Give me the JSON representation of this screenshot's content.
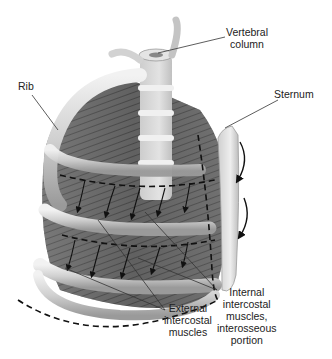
{
  "diagram": {
    "type": "anatomical illustration",
    "labels": {
      "vertebral_column": [
        "Vertebral",
        "column"
      ],
      "rib": [
        "Rib"
      ],
      "sternum": [
        "Sternum"
      ],
      "internal_intercostal": [
        "Internal",
        "intercostal",
        "muscles,",
        "interosseous",
        "portion"
      ],
      "external_intercostal": [
        "External",
        "intercostal",
        "muscles"
      ]
    },
    "colors": {
      "background": "#ffffff",
      "bone_light": "#e6e6e6",
      "bone_mid": "#b5b5b5",
      "muscle_dark": "#5a5a5a",
      "leader_line": "#333333",
      "dashed_outline": "#111111"
    }
  }
}
